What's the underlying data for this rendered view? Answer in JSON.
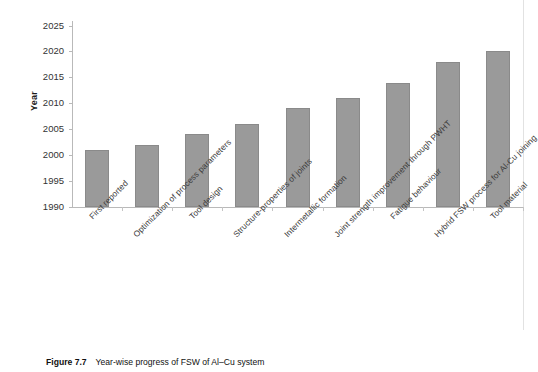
{
  "figure": {
    "caption_label": "Figure 7.7",
    "caption_text": "Year-wise progress of FSW of Al–Cu system"
  },
  "chart_data": {
    "type": "bar",
    "title": "",
    "xlabel": "",
    "ylabel": "Year",
    "ylim": [
      1990,
      2025
    ],
    "ytick_step": 5,
    "grid": false,
    "legend": null,
    "bar_color": "#9a9a9a",
    "bar_edge_color": "#8a8a8a",
    "axis_color": "#b9b9b9",
    "ticks": [
      "1990",
      "1995",
      "2000",
      "2005",
      "2010",
      "2015",
      "2020",
      "2025"
    ],
    "categories": [
      "First reported",
      "Optimization of process parameters",
      "Tool design",
      "Structure-properties of joints",
      "Intermetallic formation",
      "Joint strength improvement through PWHT",
      "Fatigue behaviour",
      "Hybrid FSW process for Al-Cu joining",
      "Tool material"
    ],
    "values": [
      2001,
      2002,
      2004,
      2006,
      2009,
      2011,
      2014,
      2018,
      2020
    ]
  }
}
